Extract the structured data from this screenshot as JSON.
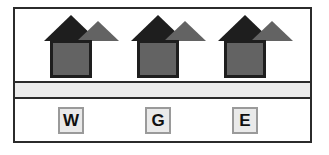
{
  "diagram": {
    "frame": {
      "border_color": "#2b2b2b",
      "background_color": "#ffffff"
    },
    "houses": [
      {
        "id": "house-west",
        "fill_color": "#636363",
        "outline_color": "#1e1e1e"
      },
      {
        "id": "house-center",
        "fill_color": "#636363",
        "outline_color": "#1e1e1e"
      },
      {
        "id": "house-east",
        "fill_color": "#636363",
        "outline_color": "#1e1e1e"
      }
    ],
    "road": {
      "fill_color": "#ececec",
      "edge_color": "#2b2b2b"
    },
    "labels": [
      {
        "text": "W",
        "fill_color": "#eaeaea",
        "border_color": "#9a9a9a"
      },
      {
        "text": "G",
        "fill_color": "#eaeaea",
        "border_color": "#9a9a9a"
      },
      {
        "text": "E",
        "fill_color": "#eaeaea",
        "border_color": "#9a9a9a"
      }
    ]
  }
}
